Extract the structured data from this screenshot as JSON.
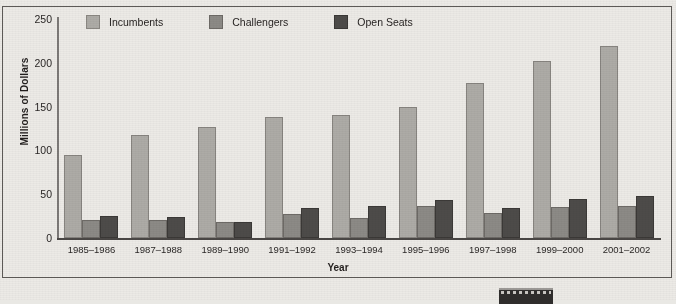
{
  "chart_data": {
    "type": "bar",
    "title": "",
    "xlabel": "Year",
    "ylabel": "Millions of Dollars",
    "ylim": [
      0,
      250
    ],
    "yticks": [
      0,
      50,
      100,
      150,
      200,
      250
    ],
    "grid": false,
    "legend_position": "top",
    "categories": [
      "1985–1986",
      "1987–1988",
      "1989–1990",
      "1991–1992",
      "1993–1994",
      "1995–1996",
      "1997–1998",
      "1999–2000",
      "2001–2002"
    ],
    "series": [
      {
        "name": "Incumbents",
        "color": "#adaba6",
        "values": [
          95,
          118,
          127,
          138,
          140,
          150,
          177,
          202,
          219
        ]
      },
      {
        "name": "Challengers",
        "color": "#8c8a86",
        "values": [
          21,
          20,
          18,
          27,
          23,
          37,
          29,
          35,
          36
        ]
      },
      {
        "name": "Open Seats",
        "color": "#4d4b49",
        "values": [
          25,
          24,
          18,
          34,
          37,
          43,
          34,
          45,
          48
        ]
      }
    ]
  }
}
